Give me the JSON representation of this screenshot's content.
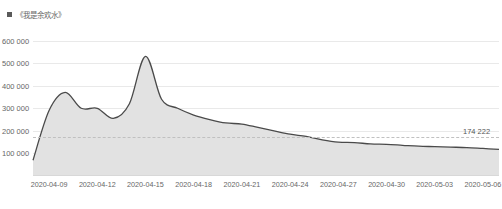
{
  "legend": {
    "label": "《我是余欢水》",
    "marker_color": "#5a5a5a",
    "marker_name": "legend-swatch"
  },
  "chart_data": {
    "type": "area",
    "title": "",
    "subtitle": "",
    "xlabel": "",
    "ylabel": "",
    "grid": true,
    "legend_position": "top-left",
    "line_color": "#4a4a4a",
    "fill_color": "#e2e2e2",
    "ylim": [
      0,
      620000
    ],
    "yticks": [
      100000,
      200000,
      300000,
      400000,
      500000,
      600000
    ],
    "ytick_labels": [
      "100 000",
      "200 000",
      "300 000",
      "400 000",
      "500 000",
      "600 000"
    ],
    "xlim": [
      "2020-04-08",
      "2020-05-07"
    ],
    "xticks": [
      "2020-04-09",
      "2020-04-12",
      "2020-04-15",
      "2020-04-18",
      "2020-04-21",
      "2020-04-24",
      "2020-04-27",
      "2020-04-30",
      "2020-05-03",
      "2020-05-06"
    ],
    "reference_line": {
      "value": 174222,
      "label": "174 222",
      "style": "dashed",
      "color": "#c0c0c0"
    },
    "series": [
      {
        "name": "《我是余欢水》",
        "x": [
          "2020-04-08",
          "2020-04-09",
          "2020-04-10",
          "2020-04-11",
          "2020-04-12",
          "2020-04-13",
          "2020-04-14",
          "2020-04-15",
          "2020-04-16",
          "2020-04-17",
          "2020-04-18",
          "2020-04-19",
          "2020-04-20",
          "2020-04-21",
          "2020-04-22",
          "2020-04-23",
          "2020-04-24",
          "2020-04-25",
          "2020-04-26",
          "2020-04-27",
          "2020-04-28",
          "2020-04-29",
          "2020-04-30",
          "2020-05-01",
          "2020-05-02",
          "2020-05-03",
          "2020-05-04",
          "2020-05-05",
          "2020-05-06",
          "2020-05-07"
        ],
        "values": [
          70000,
          290000,
          370000,
          300000,
          300000,
          255000,
          320000,
          530000,
          340000,
          300000,
          270000,
          250000,
          235000,
          230000,
          215000,
          200000,
          185000,
          175000,
          160000,
          150000,
          148000,
          142000,
          140000,
          136000,
          132000,
          130000,
          128000,
          126000,
          122000,
          118000
        ]
      }
    ]
  }
}
